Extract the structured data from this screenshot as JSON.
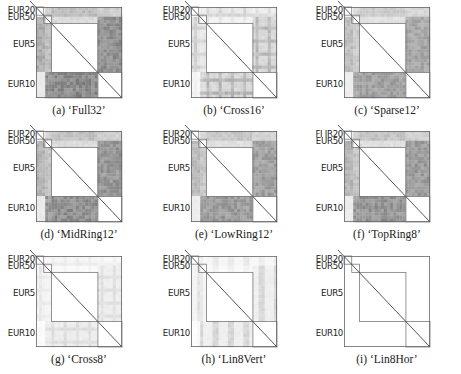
{
  "figure": {
    "row_labels": [
      "EUR20",
      "EUR50",
      "EUR5",
      "EUR10"
    ],
    "block_boundaries": [
      0,
      0.09,
      0.18,
      0.72,
      1.0
    ],
    "panels": [
      {
        "id": "a",
        "caption": "(a) ‘Full32’",
        "intensity": 1.0,
        "pattern": "full"
      },
      {
        "id": "b",
        "caption": "(b) ‘Cross16’",
        "intensity": 0.62,
        "pattern": "cross"
      },
      {
        "id": "c",
        "caption": "(c) ‘Sparse12’",
        "intensity": 0.8,
        "pattern": "full"
      },
      {
        "id": "d",
        "caption": "(d) ‘MidRing12’",
        "intensity": 0.95,
        "pattern": "full"
      },
      {
        "id": "e",
        "caption": "(e) ‘LowRing12’",
        "intensity": 0.85,
        "pattern": "full"
      },
      {
        "id": "f",
        "caption": "(f) ‘TopRing8’",
        "intensity": 0.9,
        "pattern": "full"
      },
      {
        "id": "g",
        "caption": "(g) ‘Cross8’",
        "intensity": 0.28,
        "pattern": "cross"
      },
      {
        "id": "h",
        "caption": "(h) ‘Lin8Vert’",
        "intensity": 0.32,
        "pattern": "vert"
      },
      {
        "id": "i",
        "caption": "(i) ‘Lin8Hor’",
        "intensity": 0.04,
        "pattern": "none"
      }
    ],
    "panel_f_first_label": "FI IR20",
    "colors": {
      "ink": "#222222",
      "line": "#555555",
      "cell_dark": "#6e6e6e",
      "background": "#ffffff"
    }
  }
}
